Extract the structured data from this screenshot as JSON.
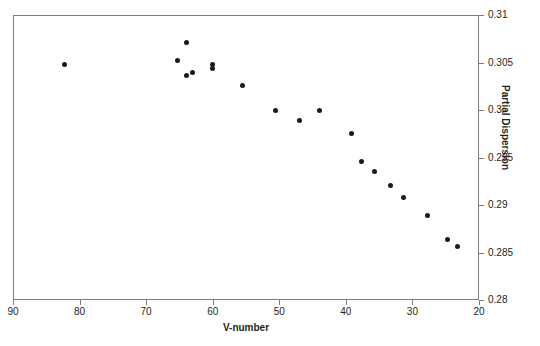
{
  "chart_data": {
    "type": "scatter",
    "title": "",
    "xlabel": "V-number",
    "ylabel": "Partial Dispersion",
    "xlim": [
      90,
      20
    ],
    "ylim": [
      0.28,
      0.31
    ],
    "x_reversed": true,
    "y_axis_position": "right",
    "grid": false,
    "legend": null,
    "xticks": [
      90,
      80,
      70,
      60,
      50,
      40,
      30,
      20
    ],
    "xtick_labels": [
      "90",
      "80",
      "70",
      "60",
      "50",
      "40",
      "30",
      "20"
    ],
    "yticks": [
      0.28,
      0.285,
      0.29,
      0.295,
      0.3,
      0.305,
      0.31
    ],
    "ytick_labels": [
      "0.28",
      "0.285",
      "0.29",
      "0.295",
      "0.3",
      "0.305",
      "0.31"
    ],
    "marker": "circle",
    "marker_color": "#1a1a1a",
    "marker_size": 5,
    "frame_color": "#7d7d7d",
    "background_color": "#ffffff",
    "points": [
      {
        "x": 82.2,
        "y": 0.3048
      },
      {
        "x": 65.3,
        "y": 0.3052
      },
      {
        "x": 63.9,
        "y": 0.3071
      },
      {
        "x": 64.0,
        "y": 0.3036
      },
      {
        "x": 63.0,
        "y": 0.304
      },
      {
        "x": 60.0,
        "y": 0.3048
      },
      {
        "x": 60.0,
        "y": 0.3044
      },
      {
        "x": 55.5,
        "y": 0.3026
      },
      {
        "x": 50.5,
        "y": 0.3
      },
      {
        "x": 47.0,
        "y": 0.2989
      },
      {
        "x": 44.0,
        "y": 0.3
      },
      {
        "x": 39.2,
        "y": 0.2975
      },
      {
        "x": 37.6,
        "y": 0.2946
      },
      {
        "x": 35.7,
        "y": 0.2935
      },
      {
        "x": 33.3,
        "y": 0.2921
      },
      {
        "x": 31.4,
        "y": 0.2908
      },
      {
        "x": 27.7,
        "y": 0.2889
      },
      {
        "x": 24.8,
        "y": 0.2864
      },
      {
        "x": 23.3,
        "y": 0.2856
      }
    ]
  }
}
